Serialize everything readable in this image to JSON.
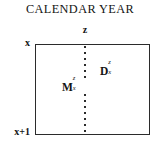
{
  "figure": {
    "title": "CALENDAR YEAR",
    "top_axis_label": "z",
    "left_axis_top_label": "x",
    "left_axis_bottom_label": "x+1",
    "box": {
      "border_color": "#2b2b2b",
      "fill_color": "#ffffff"
    },
    "cohort_line": {
      "style": "dotted",
      "color": "#2b2b2b"
    },
    "symbols": [
      {
        "id": "migrants",
        "base": "M",
        "superscript": "z",
        "subscript": "x"
      },
      {
        "id": "deaths",
        "base": "D",
        "superscript": "z",
        "subscript": "x"
      }
    ]
  },
  "colors": {
    "background": "#ffffff",
    "ink": "#141414",
    "rule": "#2b2b2b"
  }
}
